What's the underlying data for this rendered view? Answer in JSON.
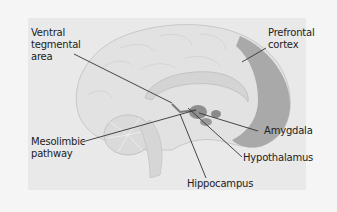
{
  "diagram": {
    "type": "anatomical brain sagittal section",
    "colors": {
      "background": "#f5f5f5",
      "panel": "#e9e9e9",
      "brain_fill": "#e2e2e2",
      "brain_outline": "#c8c8c8",
      "prefrontal_cortex": "#a9a9a9",
      "deep_structures": "#8f8f8f",
      "leader_line": "#333333",
      "text": "#222222"
    },
    "labels": [
      {
        "id": "vta",
        "text": "Ventral\ntegmental\narea"
      },
      {
        "id": "prefrontal",
        "text": "Prefrontal\ncortex"
      },
      {
        "id": "mesolimbic",
        "text": "Mesolimbic\npathway"
      },
      {
        "id": "amygdala",
        "text": "Amygdala"
      },
      {
        "id": "hypothalamus",
        "text": "Hypothalamus"
      },
      {
        "id": "hippocampus",
        "text": "Hippocampus"
      }
    ]
  }
}
